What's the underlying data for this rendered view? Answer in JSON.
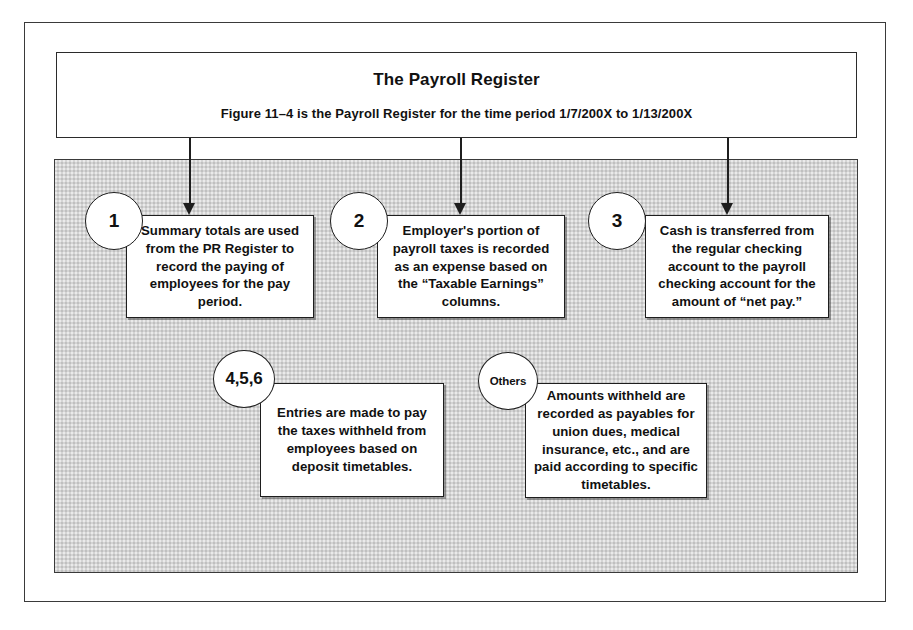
{
  "figure": {
    "header": {
      "title": "The Payroll Register",
      "subtitle": "Figure 11–4 is the Payroll Register for the time period 1/7/200X to 1/13/200X"
    },
    "panel": {
      "caption": "Journal Entries",
      "fill_color": "#d4d4d4"
    },
    "frame": {
      "border_color": "#3a3a3a"
    },
    "steps": [
      {
        "marker": "1",
        "text": "Summary totals are used from the PR Register to record the paying of employees for the pay period.",
        "has_connector": true
      },
      {
        "marker": "2",
        "text": "Employer's portion of payroll taxes is recorded as an expense based on the “Taxable Earnings” columns.",
        "has_connector": true
      },
      {
        "marker": "3",
        "text": "Cash is transferred from the regular checking account to the payroll checking account for the amount of “net pay.”",
        "has_connector": true
      },
      {
        "marker": "4,5,6",
        "text": "Entries are made to pay the taxes withheld from employees based on deposit timetables.",
        "has_connector": false
      },
      {
        "marker": "Others",
        "text": "Amounts withheld are recorded as payables for union dues, medical insurance, etc., and are paid according to specific timetables.",
        "has_connector": false
      }
    ]
  }
}
